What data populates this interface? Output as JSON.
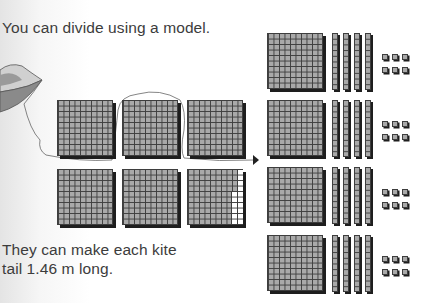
{
  "text": {
    "intro": "You can divide using a model.",
    "conclusion_line1": "They can make each kite",
    "conclusion_line2": "tail 1.46 m long."
  },
  "model": {
    "dividend_blocks": {
      "flats": 6,
      "description": "5.84 represented as 6 hundred-flats with 16 unit cells removed"
    },
    "groups": 4,
    "per_group": {
      "flats": 1,
      "rods": 4,
      "units": 6
    },
    "quotient": "1.46",
    "unit": "m"
  },
  "colors": {
    "cell_fill": "#a9a9a9",
    "grid_line": "#3e3e3e",
    "shadow": "#1e1e1e"
  }
}
